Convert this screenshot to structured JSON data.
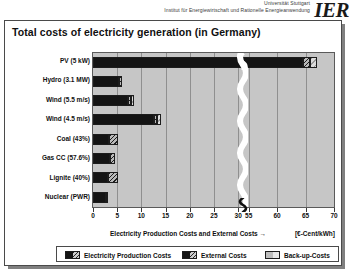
{
  "header": {
    "org_line1": "Universität Stuttgart",
    "org_line2": "Institut für Energiewirtschaft und Rationelle Energieanwendung",
    "logo": "IER"
  },
  "chart_title": "Total costs of electricity generation (in Germany)",
  "axis": {
    "xlabel_main": "Electricity Production Costs and External Costs  →",
    "xlabel_unit": "[€-Cent/kWh]",
    "xticks": [
      "0",
      "5",
      "10",
      "15",
      "20",
      "25",
      "30",
      "55",
      "60",
      "65",
      "70"
    ],
    "break_after": "30",
    "break_before": "55"
  },
  "legend": {
    "items": [
      {
        "label": "Electricity Production Costs",
        "key": "production"
      },
      {
        "label": "External Costs",
        "key": "external"
      },
      {
        "label": "Back-up-Costs",
        "key": "backup"
      }
    ]
  },
  "chart_data": {
    "type": "bar",
    "orientation": "horizontal",
    "stacked": true,
    "title": "Total costs of electricity generation (in Germany)",
    "xlabel": "Electricity Production Costs and External Costs → [€-Cent/kWh]",
    "ylabel": "",
    "xlim": [
      0,
      70
    ],
    "axis_break": [
      31,
      54
    ],
    "grid": true,
    "legend_position": "bottom",
    "categories": [
      "PV (5 kW)",
      "Hydro (3.1 MW)",
      "Wind (5.5 m/s)",
      "Wind (4.5 m/s)",
      "Coal (43%)",
      "Gas CC (57.6%)",
      "Lignite (40%)",
      "Nuclear (PWR)"
    ],
    "series": [
      {
        "name": "Electricity Production Costs",
        "color": "#141414",
        "values": [
          64.5,
          5.4,
          7.3,
          12.6,
          3.3,
          3.5,
          3.1,
          2.6
        ]
      },
      {
        "name": "External Costs",
        "color": "#b9b9b9",
        "values": [
          1.2,
          0.5,
          0.5,
          0.6,
          1.9,
          1.0,
          2.1,
          0.6
        ]
      },
      {
        "name": "Back-up-Costs",
        "color": "#dcdcdc",
        "values": [
          1.3,
          0.0,
          0.6,
          0.8,
          0.0,
          0.0,
          0.0,
          0.0
        ]
      }
    ],
    "totals": [
      67.0,
      5.9,
      8.4,
      14.0,
      5.2,
      4.5,
      5.2,
      3.2
    ]
  },
  "colors": {
    "plot_background": "#c6c6c6",
    "production": "#141414",
    "external": "#b9b9b9",
    "backup": "#dcdcdc",
    "frame": "#4a4a4a"
  }
}
